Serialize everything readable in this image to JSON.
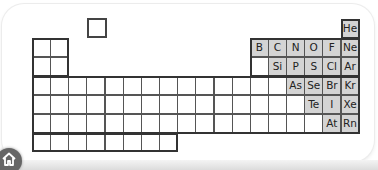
{
  "diagram": {
    "highlight_color": "#d4d4d4",
    "line_color": "#555555",
    "lone_square": {
      "label": "",
      "description": "detached hydrogen square"
    },
    "elements": [
      {
        "symbol": "He",
        "row": 1,
        "col": 18
      },
      {
        "symbol": "B",
        "row": 2,
        "col": 13
      },
      {
        "symbol": "C",
        "row": 2,
        "col": 14
      },
      {
        "symbol": "N",
        "row": 2,
        "col": 15
      },
      {
        "symbol": "O",
        "row": 2,
        "col": 16
      },
      {
        "symbol": "F",
        "row": 2,
        "col": 17
      },
      {
        "symbol": "Ne",
        "row": 2,
        "col": 18
      },
      {
        "symbol": "Si",
        "row": 3,
        "col": 14
      },
      {
        "symbol": "P",
        "row": 3,
        "col": 15
      },
      {
        "symbol": "S",
        "row": 3,
        "col": 16
      },
      {
        "symbol": "Cl",
        "row": 3,
        "col": 17
      },
      {
        "symbol": "Ar",
        "row": 3,
        "col": 18
      },
      {
        "symbol": "As",
        "row": 4,
        "col": 15
      },
      {
        "symbol": "Se",
        "row": 4,
        "col": 16
      },
      {
        "symbol": "Br",
        "row": 4,
        "col": 17
      },
      {
        "symbol": "Kr",
        "row": 4,
        "col": 18
      },
      {
        "symbol": "Te",
        "row": 5,
        "col": 16
      },
      {
        "symbol": "I",
        "row": 5,
        "col": 17
      },
      {
        "symbol": "Xe",
        "row": 5,
        "col": 18
      },
      {
        "symbol": "At",
        "row": 6,
        "col": 17
      },
      {
        "symbol": "Rn",
        "row": 6,
        "col": 18
      }
    ]
  },
  "nav": {
    "home_icon": "home-icon"
  }
}
